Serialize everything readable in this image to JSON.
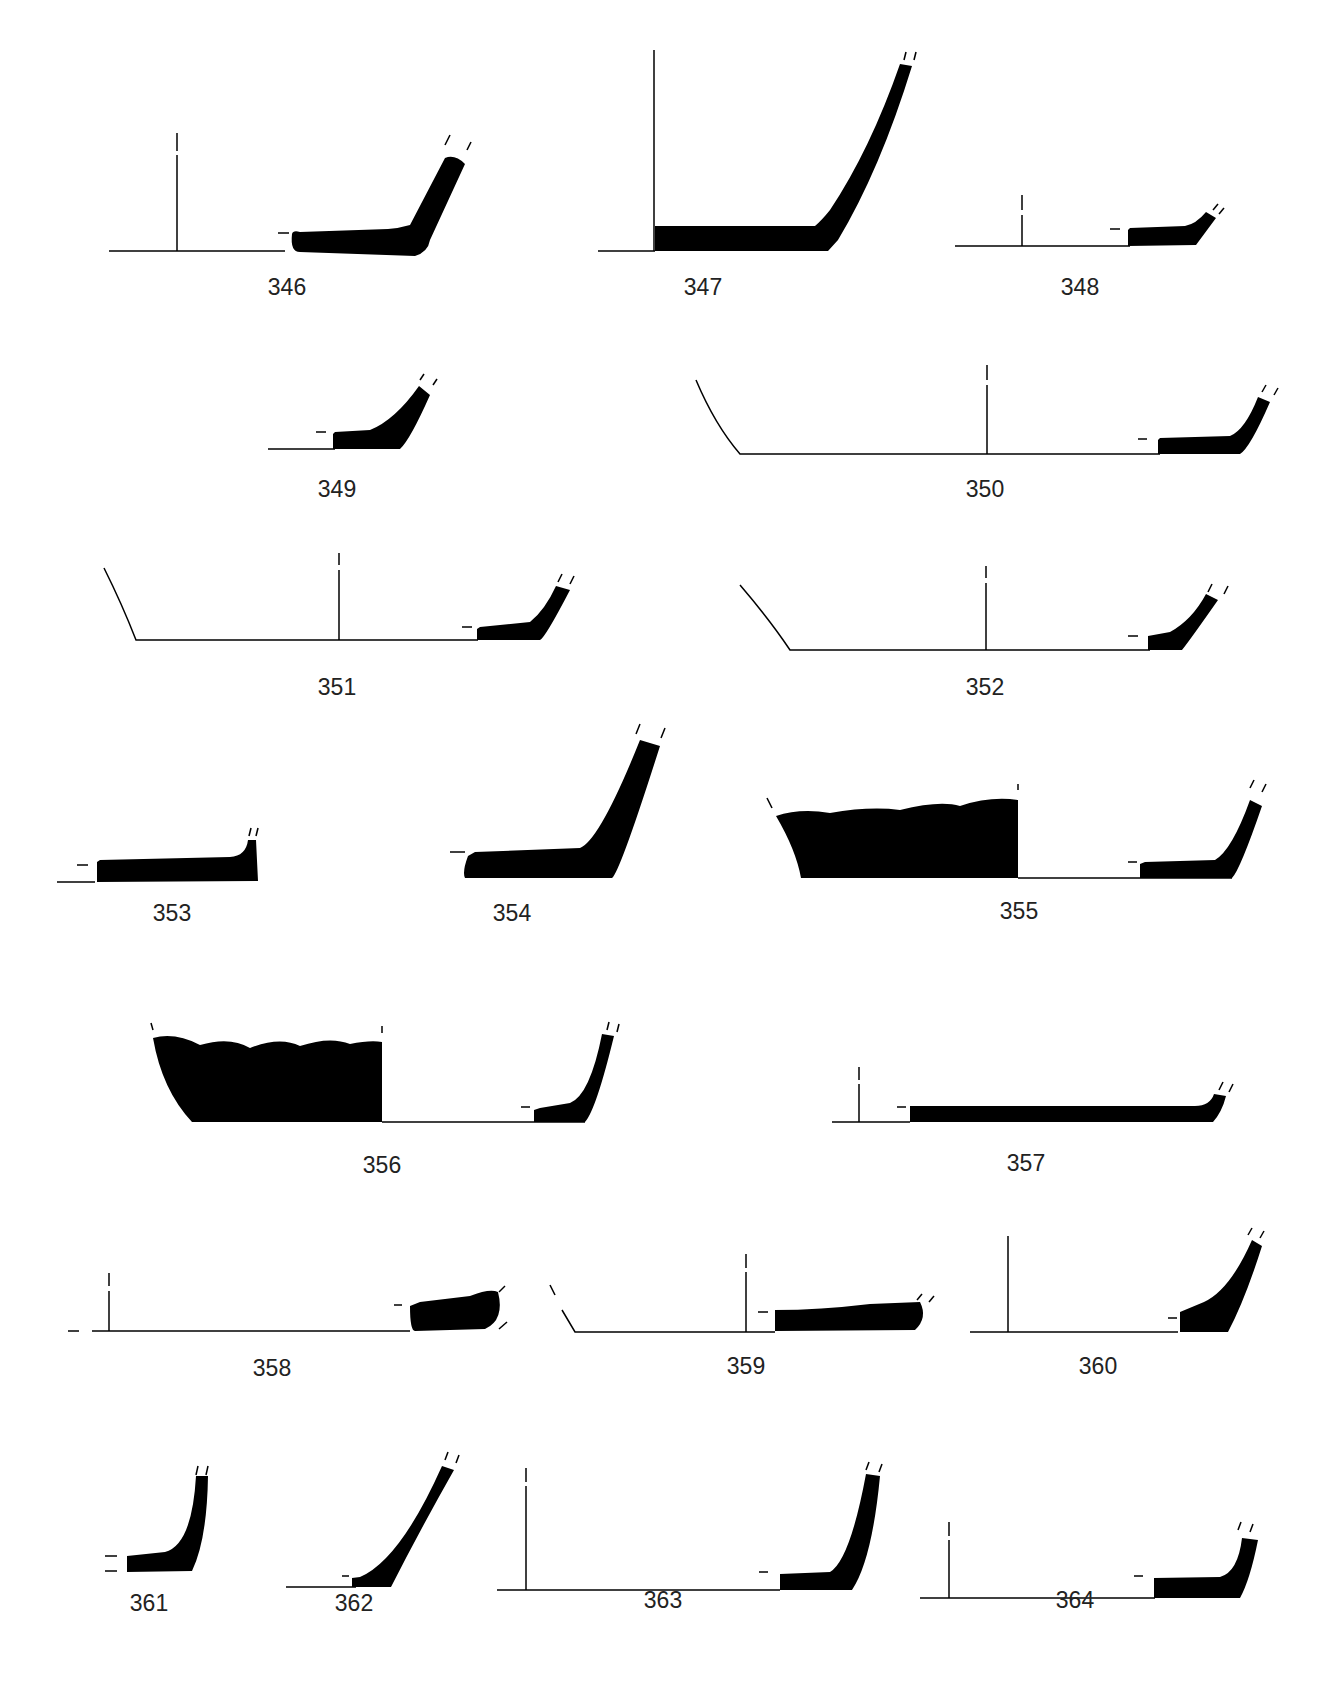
{
  "plate": {
    "description": "Pottery base profile drawings",
    "ink_color": "#000000",
    "background": "#ffffff"
  },
  "figures": [
    {
      "id": "346",
      "label": "346",
      "x": 285,
      "y": 298
    },
    {
      "id": "347",
      "label": "347",
      "x": 703,
      "y": 298
    },
    {
      "id": "348",
      "label": "348",
      "x": 1080,
      "y": 298
    },
    {
      "id": "349",
      "label": "349",
      "x": 337,
      "y": 500
    },
    {
      "id": "350",
      "label": "350",
      "x": 985,
      "y": 500
    },
    {
      "id": "351",
      "label": "351",
      "x": 337,
      "y": 697
    },
    {
      "id": "352",
      "label": "352",
      "x": 985,
      "y": 697
    },
    {
      "id": "353",
      "label": "353",
      "x": 172,
      "y": 923
    },
    {
      "id": "354",
      "label": "354",
      "x": 512,
      "y": 923
    },
    {
      "id": "355",
      "label": "355",
      "x": 1019,
      "y": 923
    },
    {
      "id": "356",
      "label": "356",
      "x": 382,
      "y": 1175
    },
    {
      "id": "357",
      "label": "357",
      "x": 1026,
      "y": 1175
    },
    {
      "id": "358",
      "label": "358",
      "x": 272,
      "y": 1378
    },
    {
      "id": "359",
      "label": "359",
      "x": 746,
      "y": 1378
    },
    {
      "id": "360",
      "label": "360",
      "x": 1098,
      "y": 1378
    },
    {
      "id": "361",
      "label": "361",
      "x": 149,
      "y": 1613
    },
    {
      "id": "362",
      "label": "362",
      "x": 354,
      "y": 1613
    },
    {
      "id": "363",
      "label": "363",
      "x": 663,
      "y": 1610
    },
    {
      "id": "364",
      "label": "364",
      "x": 1075,
      "y": 1610
    }
  ]
}
